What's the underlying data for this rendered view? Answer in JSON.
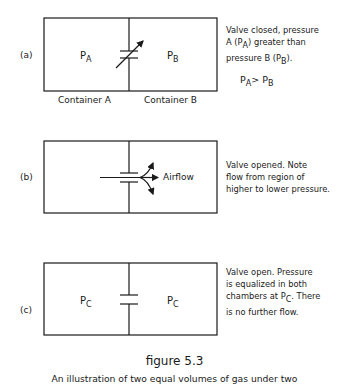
{
  "panels": [
    {
      "id": "a",
      "label": "(a)",
      "left_pressure": "P",
      "left_sub": "A",
      "right_pressure": "P",
      "right_sub": "B",
      "valve_state": "closed",
      "container_labels": [
        "Container  A",
        "Container  B"
      ],
      "description_lines": [
        "Valve closed, pressure",
        "A (P",
        "A",
        ") greater than",
        "pressure B (P",
        "B",
        ")."
      ],
      "inequality": {
        "left": "P",
        "left_sub": "A",
        "op": ">",
        "right": "P",
        "right_sub": "B"
      }
    },
    {
      "id": "b",
      "label": "(b)",
      "valve_state": "opened",
      "flow_label": "Airflow",
      "description_lines": [
        "Valve opened.  Note",
        "flow from region of",
        "higher to lower pressure."
      ]
    },
    {
      "id": "c",
      "label": "(c)",
      "left_pressure": "P",
      "left_sub": "C",
      "right_pressure": "P",
      "right_sub": "C",
      "valve_state": "open",
      "description_lines": [
        "Valve open.  Pressure",
        "is equalized in both",
        "chambers at P",
        "C",
        ".  There",
        "is no further flow."
      ]
    }
  ],
  "caption": {
    "title": "figure 5.3",
    "text": "An illustration of two equal volumes of gas under two"
  }
}
